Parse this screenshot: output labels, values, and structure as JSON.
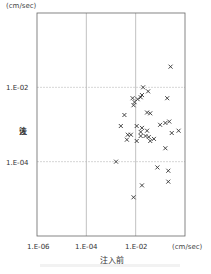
{
  "chart_data": {
    "type": "scatter",
    "title": "",
    "xlabel": "注入前",
    "ylabel": "注入後",
    "x_unit": "(cm/sec)",
    "y_unit": "(cm/sec)",
    "x_scale": "log",
    "y_scale": "log",
    "xlim": [
      1e-06,
      1.0
    ],
    "ylim": [
      1e-06,
      1.0
    ],
    "x_ticks": [
      "1.E-06",
      "1.E-04",
      "1.E-02"
    ],
    "y_ticks": [
      "1.E-02",
      "1.E-04"
    ],
    "grid": true,
    "marker": "x",
    "points": [
      {
        "x": 0.26,
        "y": 0.036
      },
      {
        "x": 0.02,
        "y": 0.01
      },
      {
        "x": 0.032,
        "y": 0.0078
      },
      {
        "x": 0.0075,
        "y": 0.0051
      },
      {
        "x": 0.018,
        "y": 0.0062
      },
      {
        "x": 0.016,
        "y": 0.0054
      },
      {
        "x": 0.012,
        "y": 0.0048
      },
      {
        "x": 0.009,
        "y": 0.004
      },
      {
        "x": 0.0082,
        "y": 0.0033
      },
      {
        "x": 0.19,
        "y": 0.0051
      },
      {
        "x": 0.0035,
        "y": 0.0018
      },
      {
        "x": 0.029,
        "y": 0.0021
      },
      {
        "x": 0.039,
        "y": 0.002
      },
      {
        "x": 0.098,
        "y": 0.00098
      },
      {
        "x": 0.16,
        "y": 0.0011
      },
      {
        "x": 0.23,
        "y": 0.0012
      },
      {
        "x": 0.0025,
        "y": 0.00091
      },
      {
        "x": 0.011,
        "y": 0.00091
      },
      {
        "x": 0.018,
        "y": 0.00081
      },
      {
        "x": 0.016,
        "y": 0.00063
      },
      {
        "x": 0.029,
        "y": 0.00068
      },
      {
        "x": 0.0048,
        "y": 0.00053
      },
      {
        "x": 0.0064,
        "y": 0.00053
      },
      {
        "x": 0.016,
        "y": 0.00049
      },
      {
        "x": 0.025,
        "y": 0.00049
      },
      {
        "x": 0.034,
        "y": 0.00046
      },
      {
        "x": 0.0044,
        "y": 0.00039
      },
      {
        "x": 0.011,
        "y": 0.00036
      },
      {
        "x": 0.039,
        "y": 0.00036
      },
      {
        "x": 0.055,
        "y": 0.00041
      },
      {
        "x": 0.29,
        "y": 0.00059
      },
      {
        "x": 0.55,
        "y": 0.00068
      },
      {
        "x": 0.16,
        "y": 0.00023
      },
      {
        "x": 0.0016,
        "y": 0.0001
      },
      {
        "x": 0.076,
        "y": 7e-05
      },
      {
        "x": 0.21,
        "y": 5.7e-05
      },
      {
        "x": 0.21,
        "y": 2.9e-05
      },
      {
        "x": 0.018,
        "y": 2.3e-05
      },
      {
        "x": 0.0082,
        "y": 1.1e-05
      }
    ]
  },
  "labels": {
    "y_unit": "(cm/sec)",
    "x_unit": "(cm/sec)",
    "y_axis_title_chars": [
      "注",
      "入",
      "後"
    ],
    "x_axis_title": "注入前",
    "x_ticks": [
      "1.E-06",
      "1.E-04",
      "1.E-02"
    ],
    "y_ticks": [
      "1.E-02",
      "1.E-04"
    ]
  }
}
